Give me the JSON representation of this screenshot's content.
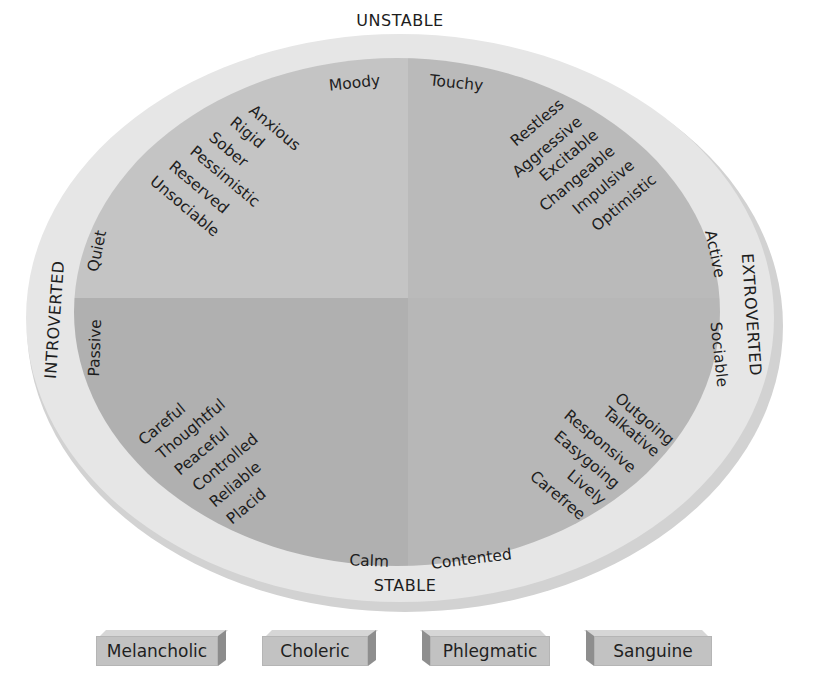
{
  "diagram": {
    "type": "personality-dimensions-circle",
    "axes": {
      "top": "UNSTABLE",
      "bottom": "STABLE",
      "left": "INTROVERTED",
      "right": "EXTROVERTED"
    },
    "quadrants": {
      "top_left": {
        "edge_top": "Moody",
        "edge_left": "Quiet",
        "traits": [
          "Anxious",
          "Rigid",
          "Sober",
          "Pessimistic",
          "Reserved",
          "Unsociable"
        ]
      },
      "top_right": {
        "edge_top": "Touchy",
        "edge_right": "Active",
        "traits": [
          "Restless",
          "Aggressive",
          "Excitable",
          "Changeable",
          "Impulsive",
          "Optimistic"
        ]
      },
      "bottom_left": {
        "edge_left": "Passive",
        "edge_bottom": "Calm",
        "traits": [
          "Careful",
          "Thoughtful",
          "Peaceful",
          "Controlled",
          "Reliable",
          "Placid"
        ]
      },
      "bottom_right": {
        "edge_right": "Sociable",
        "edge_bottom": "Contented",
        "traits": [
          "Outgoing",
          "Talkative",
          "Responsive",
          "Easygoing",
          "Lively",
          "Carefree"
        ]
      }
    },
    "temperaments": [
      "Melancholic",
      "Choleric",
      "Phlegmatic",
      "Sanguine"
    ],
    "colors": {
      "ring": "#e4e4e4",
      "ring_shadow": "#cfcfcf",
      "quadrant_top_left": "#c3c3c3",
      "quadrant_top_right": "#b9b9b9",
      "quadrant_bottom_left": "#afafaf",
      "quadrant_bottom_right": "#b6b6b6",
      "box_face": "#c2c2c2",
      "text": "#1d1d1d"
    }
  }
}
